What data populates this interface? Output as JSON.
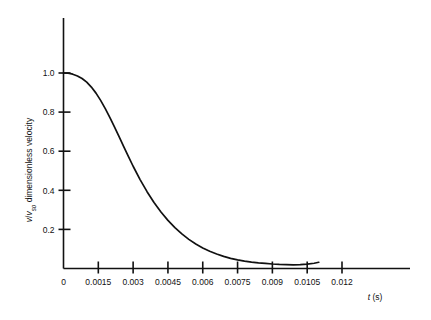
{
  "chart_data": {
    "type": "line",
    "title": "",
    "subtitle": "",
    "xlabel": "t (s)",
    "xlabel_italic_part": "t",
    "xlabel_unit_part": " (s)",
    "ylabel": "v/v_so, dimensionless velocity",
    "ylabel_numerator": "v",
    "ylabel_denominator": "v",
    "ylabel_denominator_sub": "so",
    "ylabel_rest": ", dimensionless velocity",
    "ylabel_rest_plain": " dimensionless velocity",
    "xlim": [
      0,
      0.0135
    ],
    "ylim": [
      0,
      1.18
    ],
    "grid": false,
    "legend": false,
    "legend_position": "none",
    "line_color": "#111111",
    "axis_color": "#111111",
    "background_color": "#ffffff",
    "xticks": [
      0,
      0.0015,
      0.003,
      0.0045,
      0.006,
      0.0075,
      0.009,
      0.0105,
      0.012
    ],
    "xticklabels": [
      "0",
      "0.0015",
      "0.003",
      "0.0045",
      "0.006",
      "0.0075",
      "0.009",
      "0.0105",
      "0.012"
    ],
    "yticks": [
      0.2,
      0.4,
      0.6,
      0.8,
      1.0
    ],
    "yticklabels": [
      "0.2",
      "0.4",
      "0.6",
      "0.8",
      "1.0"
    ],
    "series": [
      {
        "name": "dimensionless velocity",
        "x": [
          0.0,
          0.0002,
          0.0004,
          0.0006,
          0.0008,
          0.001,
          0.0012,
          0.0014,
          0.0016,
          0.0018,
          0.002,
          0.0022,
          0.0024,
          0.0026,
          0.0028,
          0.003,
          0.0033,
          0.0036,
          0.0039,
          0.0042,
          0.0045,
          0.0048,
          0.0051,
          0.0054,
          0.0057,
          0.006,
          0.0063,
          0.0066,
          0.0069,
          0.0072,
          0.0075,
          0.0078,
          0.0081,
          0.0084,
          0.0087,
          0.009,
          0.0093,
          0.0096,
          0.0099,
          0.0102,
          0.0105,
          0.0108,
          0.011
        ],
        "y": [
          1.0,
          0.999,
          0.994,
          0.985,
          0.972,
          0.953,
          0.928,
          0.897,
          0.86,
          0.818,
          0.772,
          0.723,
          0.673,
          0.622,
          0.572,
          0.523,
          0.455,
          0.393,
          0.338,
          0.289,
          0.246,
          0.209,
          0.177,
          0.149,
          0.125,
          0.105,
          0.088,
          0.074,
          0.062,
          0.052,
          0.044,
          0.038,
          0.033,
          0.029,
          0.026,
          0.023,
          0.021,
          0.02,
          0.019,
          0.02,
          0.022,
          0.027,
          0.032
        ]
      }
    ]
  }
}
